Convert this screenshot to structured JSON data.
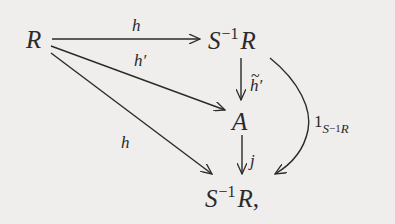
{
  "diagram": {
    "type": "commutative-diagram",
    "nodes": {
      "R": {
        "base": "R"
      },
      "S1R_top": {
        "base": "S",
        "sup": "−1",
        "tail": "R"
      },
      "A": {
        "base": "A"
      },
      "S1R_bottom": {
        "base": "S",
        "sup": "−1",
        "tail": "R",
        "punct": ","
      }
    },
    "arrows": [
      {
        "from": "R",
        "to": "S1R_top",
        "label": "h"
      },
      {
        "from": "R",
        "to": "A",
        "label": "h′"
      },
      {
        "from": "R",
        "to": "S1R_bottom",
        "label": "h"
      },
      {
        "from": "S1R_top",
        "to": "A",
        "label": "h′",
        "label_decoration": "tilde"
      },
      {
        "from": "A",
        "to": "S1R_bottom",
        "label": "j"
      },
      {
        "from": "S1R_top",
        "to": "S1R_bottom",
        "label": {
          "base": "1",
          "sub_base": "S",
          "sub_sup": "−1",
          "sub_tail": "R"
        },
        "curved": true
      }
    ],
    "colors": {
      "background": "#efeeec",
      "ink": "#2a2a2a"
    }
  }
}
